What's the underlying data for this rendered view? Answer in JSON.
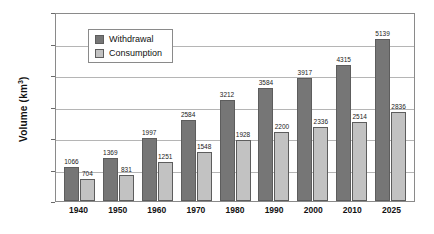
{
  "chart_data": {
    "type": "bar",
    "title": "",
    "xlabel": "",
    "ylabel": "Volume (km3)",
    "ylabel_base": "Volume (km",
    "ylabel_sup": "3",
    "ylabel_tail": ")",
    "ylim": [
      0,
      6000
    ],
    "ytick_values": [
      6000,
      5000,
      4000,
      3000,
      2000,
      1000,
      0
    ],
    "ytick_labels": [
      "6000",
      "5000",
      "4000",
      "3000",
      "2000",
      "1000",
      "0"
    ],
    "grid": true,
    "legend_position": "upper-left-inside",
    "categories": [
      "1940",
      "1950",
      "1960",
      "1970",
      "1980",
      "1990",
      "2000",
      "2010",
      "2025"
    ],
    "series": [
      {
        "name": "Withdrawal",
        "color": "#767676",
        "values": [
          1066,
          1369,
          1997,
          2584,
          3212,
          3584,
          3917,
          4315,
          5139
        ],
        "labels": [
          "1066",
          "1369",
          "1997",
          "2584",
          "3212",
          "3584",
          "3917",
          "4315",
          "5139"
        ]
      },
      {
        "name": "Consumption",
        "color": "#c2c2c2",
        "values": [
          704,
          831,
          1251,
          1548,
          1928,
          2200,
          2336,
          2514,
          2836
        ],
        "labels": [
          "704",
          "831",
          "1251",
          "1548",
          "1928",
          "2200",
          "2336",
          "2514",
          "2836"
        ]
      }
    ]
  },
  "legend": {
    "items": [
      {
        "label": "Withdrawal",
        "swatch": "withdrawal"
      },
      {
        "label": "Consumption",
        "swatch": "consumption"
      }
    ]
  },
  "colors": {
    "withdrawal": "#767676",
    "consumption": "#c2c2c2",
    "frame": "#8a8a8a",
    "gridline": "#b5b5b5",
    "text": "#111111"
  }
}
